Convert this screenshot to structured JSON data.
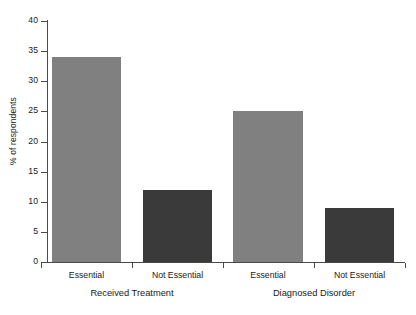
{
  "chart_data": {
    "type": "bar",
    "title": "",
    "subtitle": "",
    "xlabel": "",
    "ylabel": "% of respondents",
    "ylim": [
      0,
      40
    ],
    "yticks": [
      0,
      5,
      10,
      15,
      20,
      25,
      30,
      35,
      40
    ],
    "ytick_labels": [
      "0",
      "5",
      "10",
      "15",
      "20",
      "25",
      "30",
      "35",
      "40"
    ],
    "grid": false,
    "legend": false,
    "legend_position": "none",
    "categories": [
      "Essential",
      "Not Essential",
      "Essential",
      "Not Essential"
    ],
    "values": [
      34,
      12,
      25,
      9
    ],
    "groups": [
      {
        "label": "Received Treatment",
        "categories": [
          "Essential",
          "Not Essential"
        ],
        "values": [
          34,
          12
        ]
      },
      {
        "label": "Diagnosed Disorder",
        "categories": [
          "Essential",
          "Not Essential"
        ],
        "values": [
          25,
          9
        ]
      }
    ],
    "bars": [
      {
        "category": "Essential",
        "group": "Received Treatment",
        "value": 34,
        "color": "#808080"
      },
      {
        "category": "Not Essential",
        "group": "Received Treatment",
        "value": 12,
        "color": "#3a3a3a"
      },
      {
        "category": "Essential",
        "group": "Diagnosed Disorder",
        "value": 25,
        "color": "#808080"
      },
      {
        "category": "Not Essential",
        "group": "Diagnosed Disorder",
        "value": 9,
        "color": "#3a3a3a"
      }
    ],
    "colors": {
      "essential": "#808080",
      "not_essential": "#3a3a3a",
      "axis": "#4a4a4a",
      "background": "#ffffff",
      "text": "#1a1a1a"
    }
  }
}
